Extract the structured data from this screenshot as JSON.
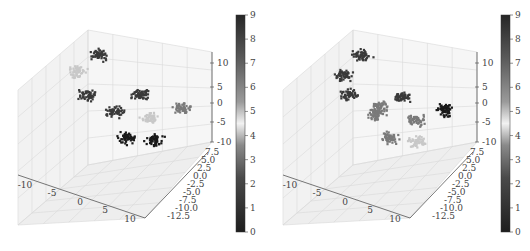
{
  "chart_data": [
    {
      "type": "scatter",
      "subtype": "3d-scatter",
      "title": "",
      "xlabel": "",
      "ylabel": "",
      "zlabel": "",
      "x_ticks": [
        "-10",
        "-5",
        "0",
        "5",
        "10"
      ],
      "y_ticks": [
        "7.5",
        "5.0",
        "2.5",
        "0.0",
        "-2.5",
        "-5.0",
        "-7.5",
        "-10.0",
        "-12.5"
      ],
      "z_ticks": [
        "10",
        "5",
        "0",
        "-5",
        "-10"
      ],
      "colorbar": {
        "ticks": [
          "0",
          "1",
          "2",
          "3",
          "4",
          "5",
          "6",
          "7",
          "8",
          "9"
        ],
        "range": [
          0,
          9
        ],
        "colormap": "gray-diverging"
      },
      "grid": true,
      "clusters": [
        {
          "label": 8,
          "screen": [
            100,
            55
          ],
          "shade": "dark"
        },
        {
          "label": 5,
          "screen": [
            78,
            72
          ],
          "shade": "light"
        },
        {
          "label": 7,
          "screen": [
            88,
            95
          ],
          "shade": "dark"
        },
        {
          "label": 8,
          "screen": [
            115,
            112
          ],
          "shade": "dark"
        },
        {
          "label": 9,
          "screen": [
            140,
            95
          ],
          "shade": "dark"
        },
        {
          "label": 6,
          "screen": [
            183,
            108
          ],
          "shade": "mid"
        },
        {
          "label": 5,
          "screen": [
            150,
            118
          ],
          "shade": "light"
        },
        {
          "label": 0,
          "screen": [
            127,
            138
          ],
          "shade": "black"
        },
        {
          "label": 1,
          "screen": [
            155,
            140
          ],
          "shade": "black"
        }
      ]
    },
    {
      "type": "scatter",
      "subtype": "3d-scatter",
      "title": "",
      "xlabel": "",
      "ylabel": "",
      "zlabel": "",
      "x_ticks": [
        "-10",
        "-5",
        "0",
        "5",
        "10"
      ],
      "y_ticks": [
        "7.5",
        "5.0",
        "2.5",
        "0.0",
        "-2.5",
        "-5.0",
        "-7.5",
        "-10.0",
        "-12.5"
      ],
      "z_ticks": [
        "10",
        "5",
        "0",
        "-5",
        "-10"
      ],
      "colorbar": {
        "ticks": [
          "0",
          "1",
          "2",
          "3",
          "4",
          "5",
          "6",
          "7",
          "8",
          "9"
        ],
        "range": [
          0,
          9
        ],
        "colormap": "gray-diverging"
      },
      "grid": true,
      "clusters": [
        {
          "label": 9,
          "screen": [
            97,
            55
          ],
          "shade": "dark"
        },
        {
          "label": 9,
          "screen": [
            78,
            75
          ],
          "shade": "dark"
        },
        {
          "label": 9,
          "screen": [
            85,
            95
          ],
          "shade": "dark"
        },
        {
          "label": 8,
          "screen": [
            138,
            97
          ],
          "shade": "dark"
        },
        {
          "label": 9,
          "screen": [
            180,
            110
          ],
          "shade": "black"
        },
        {
          "label": 6,
          "screen": [
            115,
            107
          ],
          "shade": "mid"
        },
        {
          "label": 4,
          "screen": [
            112,
            115
          ],
          "shade": "mid"
        },
        {
          "label": 6,
          "screen": [
            150,
            120
          ],
          "shade": "mid"
        },
        {
          "label": 5,
          "screen": [
            125,
            138
          ],
          "shade": "mid"
        },
        {
          "label": 5,
          "screen": [
            152,
            142
          ],
          "shade": "light"
        }
      ]
    }
  ],
  "panels": [
    {
      "name": "left",
      "x_ticks": [
        "-10",
        "-5",
        "0",
        "5",
        "10"
      ],
      "y_ticks": [
        "7.5",
        "5.0",
        "2.5",
        "0.0",
        "-2.5",
        "-5.0",
        "-7.5",
        "-10.0",
        "-12.5"
      ],
      "z_ticks": [
        "10",
        "5",
        "0",
        "-5",
        "-10"
      ],
      "cb_ticks": [
        "9",
        "8",
        "7",
        "6",
        "5",
        "4",
        "3",
        "2",
        "1",
        "0"
      ]
    },
    {
      "name": "right",
      "x_ticks": [
        "-10",
        "-5",
        "0",
        "5",
        "10"
      ],
      "y_ticks": [
        "7.5",
        "5.0",
        "2.5",
        "0.0",
        "-2.5",
        "-5.0",
        "-7.5",
        "-10.0",
        "-12.5"
      ],
      "z_ticks": [
        "10",
        "5",
        "0",
        "-5",
        "-10"
      ],
      "cb_ticks": [
        "9",
        "8",
        "7",
        "6",
        "5",
        "4",
        "3",
        "2",
        "1",
        "0"
      ]
    }
  ]
}
